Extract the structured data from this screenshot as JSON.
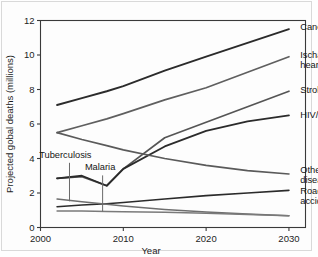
{
  "chart_data": {
    "type": "line",
    "title": "",
    "subtitle": "",
    "xlabel": "Year",
    "ylabel": "Projected gobal deaths (millions)",
    "xlim": [
      2000,
      2032
    ],
    "ylim": [
      0,
      12
    ],
    "xticks": [
      "2000",
      "2010",
      "2020",
      "2030"
    ],
    "xtick_values": [
      2000,
      2010,
      2020,
      2030
    ],
    "yticks": [
      "0",
      "2",
      "4",
      "6",
      "8",
      "10",
      "12"
    ],
    "ytick_values": [
      0,
      2,
      4,
      6,
      8,
      10,
      12
    ],
    "grid": false,
    "legend_position": "right-inline-labels",
    "x": [
      2002,
      2005,
      2008,
      2010,
      2015,
      2020,
      2025,
      2030
    ],
    "series": [
      {
        "name": "Cancers",
        "label": "Cancers",
        "color": "#2b2b2b",
        "width": 1.9,
        "label_x": 2031,
        "label_y": 11.65,
        "values": [
          7.1,
          7.5,
          7.9,
          8.2,
          9.1,
          9.9,
          10.7,
          11.5
        ]
      },
      {
        "name": "Ischaemic heart disease",
        "label": "Ischaemic heart disease",
        "color": "#5f5f5f",
        "width": 1.7,
        "label_x": 2031,
        "label_y": 10.05,
        "values": [
          5.5,
          5.9,
          6.3,
          6.6,
          7.4,
          8.1,
          9.0,
          9.9
        ]
      },
      {
        "name": "Stroke",
        "label": "Stroke",
        "color": "#555555",
        "width": 1.7,
        "label_x": 2031,
        "label_y": 8.0,
        "values": [
          2.85,
          2.95,
          2.42,
          3.4,
          5.2,
          6.1,
          7.0,
          7.9
        ]
      },
      {
        "name": "HIV/AIDS",
        "label": "HIV/AIDS",
        "color": "#2b2b2b",
        "width": 1.8,
        "label_x": 2031,
        "label_y": 6.55,
        "values": [
          2.85,
          3.0,
          2.42,
          3.4,
          4.7,
          5.6,
          6.15,
          6.5
        ]
      },
      {
        "name": "Other infectious diseases",
        "label": "Other infectious diseases",
        "color": "#5a5a5a",
        "width": 1.7,
        "label_x": 2031,
        "label_y": 3.35,
        "values": [
          5.5,
          5.1,
          4.75,
          4.5,
          4.0,
          3.6,
          3.3,
          3.1
        ]
      },
      {
        "name": "Road traffic accidents",
        "label": "Road traffic accidents",
        "color": "#2b2b2b",
        "width": 1.6,
        "label_x": 2031,
        "label_y": 2.15,
        "values": [
          1.2,
          1.3,
          1.38,
          1.45,
          1.65,
          1.85,
          2.0,
          2.15
        ]
      },
      {
        "name": "Tuberculosis",
        "label": "",
        "color": "#6e6e6e",
        "width": 1.5,
        "label_x": null,
        "label_y": null,
        "values": [
          1.65,
          1.5,
          1.35,
          1.25,
          1.05,
          0.9,
          0.78,
          0.68
        ]
      },
      {
        "name": "Malaria",
        "label": "",
        "color": "#7a7a7a",
        "width": 1.5,
        "label_x": null,
        "label_y": null,
        "values": [
          0.95,
          0.95,
          0.93,
          0.92,
          0.88,
          0.82,
          0.75,
          0.68
        ]
      }
    ],
    "annotations": [
      {
        "text": "Tuberculosis",
        "text_x": 2003.0,
        "text_y": 4.05,
        "leader_x": 2003.5,
        "leader_y_top": 3.75,
        "leader_y_bottom": 1.52
      },
      {
        "text": "Malaria",
        "text_x": 2007.2,
        "text_y": 3.35,
        "leader_x": 2007.5,
        "leader_y_top": 3.02,
        "leader_y_bottom": 0.93
      }
    ],
    "inline_series_labels": [
      "Cancers",
      "Ischaemic heart disease",
      "Stroke",
      "HIV/AIDS",
      "Other infectious diseases",
      "Road traffic accidents"
    ]
  }
}
